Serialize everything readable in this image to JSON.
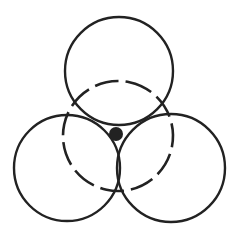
{
  "diagram": {
    "type": "overlapping-circles",
    "width": 237,
    "height": 229,
    "stroke_color": "#222222",
    "fill_color": "#222222",
    "background": "#ffffff",
    "solid_circles": [
      {
        "name": "top",
        "cx": 119,
        "cy": 71,
        "r": 54
      },
      {
        "name": "left",
        "cx": 67,
        "cy": 168,
        "r": 53
      },
      {
        "name": "right",
        "cx": 171,
        "cy": 168,
        "r": 54
      }
    ],
    "dashed_circle": {
      "name": "center-dashed",
      "cx": 118,
      "cy": 136,
      "r": 55,
      "dasharray": "24 7"
    },
    "center_dot": {
      "cx": 116,
      "cy": 134,
      "r": 7
    }
  }
}
